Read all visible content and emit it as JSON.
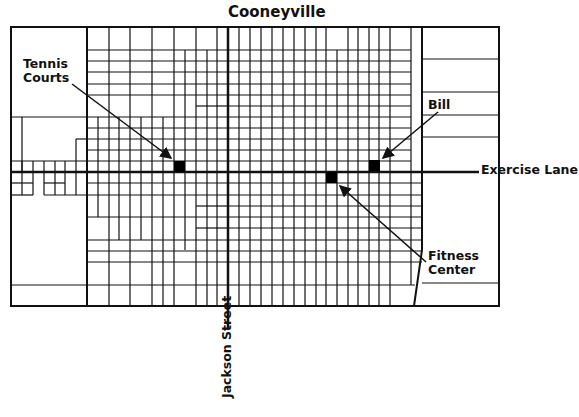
{
  "map": {
    "title": "Cooneyville",
    "streets": {
      "horizontal": "Exercise Lane",
      "vertical": "Jackson Street"
    },
    "landmarks": [
      {
        "name": "Tennis Courts",
        "line1": "Tennis",
        "line2": "Courts"
      },
      {
        "name": "Bill",
        "line1": "Bill"
      },
      {
        "name": "Fitness Center",
        "line1": "Fitness",
        "line2": "Center"
      }
    ],
    "colors": {
      "line": "#111111",
      "marker": "#000000",
      "background": "#ffffff"
    }
  }
}
